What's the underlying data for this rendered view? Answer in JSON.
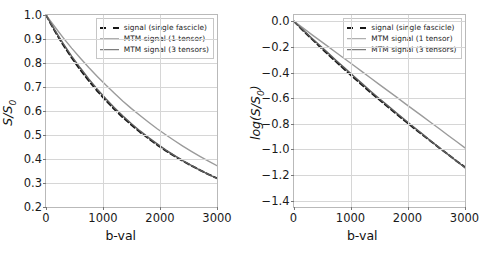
{
  "chart_data": [
    {
      "type": "line",
      "panel": "left",
      "title": "",
      "xlabel": "b-val",
      "ylabel": "S/S0",
      "ylabel_display": "S/S₀",
      "xlim": [
        0,
        3000
      ],
      "ylim": [
        0.2,
        1.0
      ],
      "xticks": [
        0,
        1000,
        2000,
        3000
      ],
      "xticklabels": [
        "0",
        "1000",
        "2000",
        "3000"
      ],
      "yticks": [
        0.2,
        0.3,
        0.4,
        0.5,
        0.6,
        0.7,
        0.8,
        0.9,
        1.0
      ],
      "yticklabels": [
        "0.2",
        "0.3",
        "0.4",
        "0.5",
        "0.6",
        "0.7",
        "0.8",
        "0.9",
        "1.0"
      ],
      "grid": true,
      "legend_position": "upper right",
      "x": [
        0,
        150,
        300,
        450,
        600,
        750,
        900,
        1050,
        1200,
        1350,
        1500,
        1650,
        1800,
        1950,
        2100,
        2250,
        2400,
        2550,
        2700,
        2850,
        3000
      ],
      "series": [
        {
          "name": "signal (single fascicle)",
          "style": "dashed",
          "color": "#171717",
          "values": [
            1.0,
            0.935,
            0.876,
            0.822,
            0.772,
            0.726,
            0.683,
            0.644,
            0.607,
            0.573,
            0.542,
            0.512,
            0.485,
            0.459,
            0.435,
            0.413,
            0.392,
            0.372,
            0.354,
            0.336,
            0.32
          ]
        },
        {
          "name": "MTM signal (1 tensor)",
          "style": "solid",
          "color": "#9b9b9b",
          "values": [
            1.0,
            0.952,
            0.906,
            0.862,
            0.821,
            0.781,
            0.744,
            0.708,
            0.674,
            0.641,
            0.61,
            0.581,
            0.553,
            0.526,
            0.501,
            0.477,
            0.454,
            0.432,
            0.411,
            0.391,
            0.372
          ]
        },
        {
          "name": "MTM signal (3 tensors)",
          "style": "solid",
          "color": "#5d5d5d",
          "values": [
            1.0,
            0.939,
            0.882,
            0.829,
            0.78,
            0.734,
            0.691,
            0.651,
            0.614,
            0.579,
            0.547,
            0.517,
            0.489,
            0.463,
            0.438,
            0.415,
            0.393,
            0.373,
            0.354,
            0.336,
            0.319
          ]
        }
      ]
    },
    {
      "type": "line",
      "panel": "right",
      "title": "",
      "xlabel": "b-val",
      "ylabel": "log(S/S0)",
      "ylabel_display": "log(S/S₀)",
      "xlim": [
        0,
        3000
      ],
      "ylim": [
        -1.45,
        0.05
      ],
      "xticks": [
        0,
        1000,
        2000,
        3000
      ],
      "xticklabels": [
        "0",
        "1000",
        "2000",
        "3000"
      ],
      "yticks": [
        -1.4,
        -1.2,
        -1.0,
        -0.8,
        -0.6,
        -0.4,
        -0.2,
        0.0
      ],
      "yticklabels": [
        "-1.4",
        "-1.2",
        "-1.0",
        "-0.8",
        "-0.6",
        "-0.4",
        "-0.2",
        "0.0"
      ],
      "grid": true,
      "legend_position": "upper right",
      "x": [
        0,
        150,
        300,
        450,
        600,
        750,
        900,
        1050,
        1200,
        1350,
        1500,
        1650,
        1800,
        1950,
        2100,
        2250,
        2400,
        2550,
        2700,
        2850,
        3000
      ],
      "series": [
        {
          "name": "signal (single fascicle)",
          "style": "dashed",
          "color": "#171717",
          "values": [
            0.0,
            -0.067,
            -0.132,
            -0.196,
            -0.259,
            -0.32,
            -0.381,
            -0.44,
            -0.499,
            -0.557,
            -0.613,
            -0.669,
            -0.724,
            -0.779,
            -0.832,
            -0.884,
            -0.936,
            -0.989,
            -1.038,
            -1.09,
            -1.139
          ]
        },
        {
          "name": "MTM signal (1 tensor)",
          "style": "solid",
          "color": "#9b9b9b",
          "values": [
            0.0,
            -0.049,
            -0.099,
            -0.148,
            -0.197,
            -0.247,
            -0.296,
            -0.345,
            -0.394,
            -0.444,
            -0.494,
            -0.543,
            -0.592,
            -0.642,
            -0.691,
            -0.74,
            -0.79,
            -0.839,
            -0.889,
            -0.938,
            -0.988
          ]
        },
        {
          "name": "MTM signal (3 tensors)",
          "style": "solid",
          "color": "#5d5d5d",
          "values": [
            0.0,
            -0.063,
            -0.126,
            -0.187,
            -0.248,
            -0.309,
            -0.369,
            -0.429,
            -0.488,
            -0.547,
            -0.604,
            -0.66,
            -0.715,
            -0.77,
            -0.825,
            -0.879,
            -0.934,
            -0.986,
            -1.039,
            -1.091,
            -1.143
          ]
        }
      ]
    }
  ],
  "legend": {
    "entries": [
      {
        "label": "signal (single fascicle)",
        "swatch": "sw-dashed"
      },
      {
        "label": "MTM signal (1 tensor)",
        "swatch": "sw-solid1"
      },
      {
        "label": "MTM signal (3 tensors)",
        "swatch": "sw-solid3"
      }
    ]
  },
  "colors": {
    "signal_single_fascicle": "#171717",
    "mtm_1_tensor": "#9b9b9b",
    "mtm_3_tensors": "#5d5d5d",
    "grid": "#d6d6d6",
    "frame": "#b9b9b9",
    "background": "#ffffff"
  }
}
